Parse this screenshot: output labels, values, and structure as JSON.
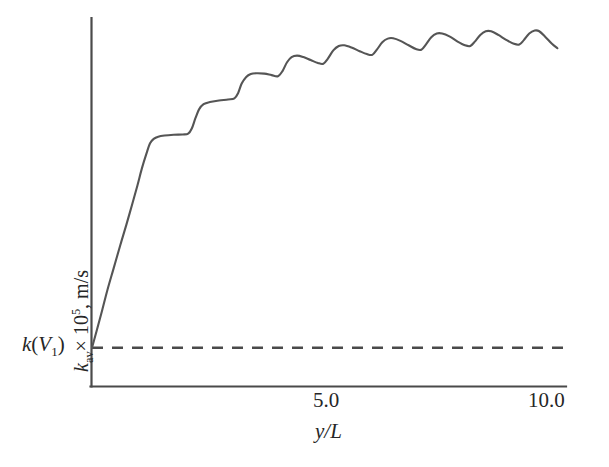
{
  "chart_data": {
    "type": "line",
    "title": "",
    "subtitle": "",
    "xlabel": "y/L",
    "ylabel": "k_av × 10⁵, m/s",
    "ylabel_parts": {
      "symbol": "k",
      "subscript": "av",
      "times": "× 10",
      "exponent": "5",
      "units": ", m/s"
    },
    "xlim": [
      0,
      10.45
    ],
    "ylim": [
      0,
      1.0
    ],
    "grid": false,
    "legend": null,
    "x_ticks": [
      5.0,
      10.0
    ],
    "x_tick_labels": [
      "5.0",
      "10.0"
    ],
    "y_ticks": [],
    "y_tick_labels": [],
    "annotations": [
      {
        "name": "k-v1-label",
        "text": "k(V1)",
        "text_parts": {
          "symbol": "k",
          "open": "(",
          "var": "V",
          "subscript": "1",
          "close": ")"
        },
        "x": 0.0,
        "y": 0.105,
        "placement": "left-of-y-axis"
      }
    ],
    "series": [
      {
        "name": "k_av step-oscillating profile",
        "style": "solid",
        "color": "#555555",
        "points": [
          [
            0.0,
            0.105
          ],
          [
            0.1,
            0.15
          ],
          [
            0.22,
            0.205
          ],
          [
            0.34,
            0.262
          ],
          [
            0.48,
            0.322
          ],
          [
            0.62,
            0.382
          ],
          [
            0.76,
            0.44
          ],
          [
            0.88,
            0.492
          ],
          [
            1.0,
            0.545
          ],
          [
            1.1,
            0.592
          ],
          [
            1.2,
            0.632
          ],
          [
            1.28,
            0.66
          ],
          [
            1.36,
            0.672
          ],
          [
            1.46,
            0.678
          ],
          [
            1.6,
            0.681
          ],
          [
            1.8,
            0.683
          ],
          [
            2.0,
            0.684
          ],
          [
            2.12,
            0.686
          ],
          [
            2.2,
            0.7
          ],
          [
            2.28,
            0.728
          ],
          [
            2.36,
            0.752
          ],
          [
            2.46,
            0.766
          ],
          [
            2.6,
            0.772
          ],
          [
            2.8,
            0.776
          ],
          [
            3.0,
            0.779
          ],
          [
            3.14,
            0.782
          ],
          [
            3.22,
            0.796
          ],
          [
            3.3,
            0.822
          ],
          [
            3.4,
            0.84
          ],
          [
            3.5,
            0.848
          ],
          [
            3.62,
            0.85
          ],
          [
            3.8,
            0.849
          ],
          [
            3.96,
            0.845
          ],
          [
            4.1,
            0.842
          ],
          [
            4.2,
            0.856
          ],
          [
            4.3,
            0.88
          ],
          [
            4.4,
            0.894
          ],
          [
            4.52,
            0.898
          ],
          [
            4.66,
            0.894
          ],
          [
            4.82,
            0.886
          ],
          [
            4.98,
            0.878
          ],
          [
            5.1,
            0.876
          ],
          [
            5.2,
            0.89
          ],
          [
            5.32,
            0.912
          ],
          [
            5.44,
            0.924
          ],
          [
            5.56,
            0.926
          ],
          [
            5.72,
            0.92
          ],
          [
            5.9,
            0.91
          ],
          [
            6.06,
            0.902
          ],
          [
            6.18,
            0.9
          ],
          [
            6.28,
            0.914
          ],
          [
            6.4,
            0.934
          ],
          [
            6.52,
            0.944
          ],
          [
            6.64,
            0.945
          ],
          [
            6.8,
            0.938
          ],
          [
            6.98,
            0.926
          ],
          [
            7.14,
            0.916
          ],
          [
            7.26,
            0.914
          ],
          [
            7.36,
            0.928
          ],
          [
            7.48,
            0.948
          ],
          [
            7.6,
            0.958
          ],
          [
            7.72,
            0.958
          ],
          [
            7.88,
            0.95
          ],
          [
            8.06,
            0.936
          ],
          [
            8.22,
            0.926
          ],
          [
            8.34,
            0.924
          ],
          [
            8.44,
            0.936
          ],
          [
            8.56,
            0.954
          ],
          [
            8.68,
            0.964
          ],
          [
            8.8,
            0.964
          ],
          [
            8.96,
            0.954
          ],
          [
            9.14,
            0.94
          ],
          [
            9.3,
            0.93
          ],
          [
            9.42,
            0.928
          ],
          [
            9.52,
            0.94
          ],
          [
            9.64,
            0.958
          ],
          [
            9.76,
            0.966
          ],
          [
            9.86,
            0.964
          ],
          [
            10.0,
            0.948
          ],
          [
            10.14,
            0.93
          ],
          [
            10.26,
            0.918
          ]
        ]
      },
      {
        "name": "k(V1) reference level",
        "style": "dashed",
        "color": "#4a4a4a",
        "constant_y": 0.105,
        "x_range": [
          0.0,
          10.5
        ]
      }
    ]
  },
  "axes": {
    "y_axis_name": "y-axis-spine",
    "x_axis_name": "x-axis-spine"
  }
}
